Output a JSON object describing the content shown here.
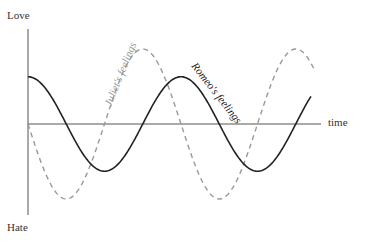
{
  "labels": {
    "y_top": "Love",
    "y_bottom": "Hate",
    "x_axis": "time",
    "series_juliet": "Juliet's feelings",
    "series_romeo": "Romeo's feelings"
  },
  "colors": {
    "axis": "#555555",
    "romeo": "#222222",
    "juliet": "#999999",
    "text": "#333333"
  },
  "chart_data": {
    "type": "line",
    "title": "",
    "xlabel": "time",
    "ylabel_top": "Love",
    "ylabel_bottom": "Hate",
    "grid": false,
    "legend": "inline labels along curves",
    "x": [
      0,
      0.25,
      0.5,
      0.75,
      1.0,
      1.25,
      1.5,
      1.75,
      1.9
    ],
    "series": [
      {
        "name": "Romeo's feelings",
        "style": "solid",
        "amplitude": 0.63,
        "phase": "cosine",
        "values": [
          0.63,
          0,
          -0.63,
          0,
          0.63,
          0,
          -0.63,
          0,
          0.38
        ]
      },
      {
        "name": "Juliet's feelings",
        "style": "dashed",
        "amplitude": 1.0,
        "phase": "negative sine",
        "values": [
          0,
          -1.0,
          0,
          1.0,
          0,
          -1.0,
          0,
          1.0,
          0.8
        ]
      }
    ],
    "ylim": [
      -1.2,
      1.2
    ]
  }
}
